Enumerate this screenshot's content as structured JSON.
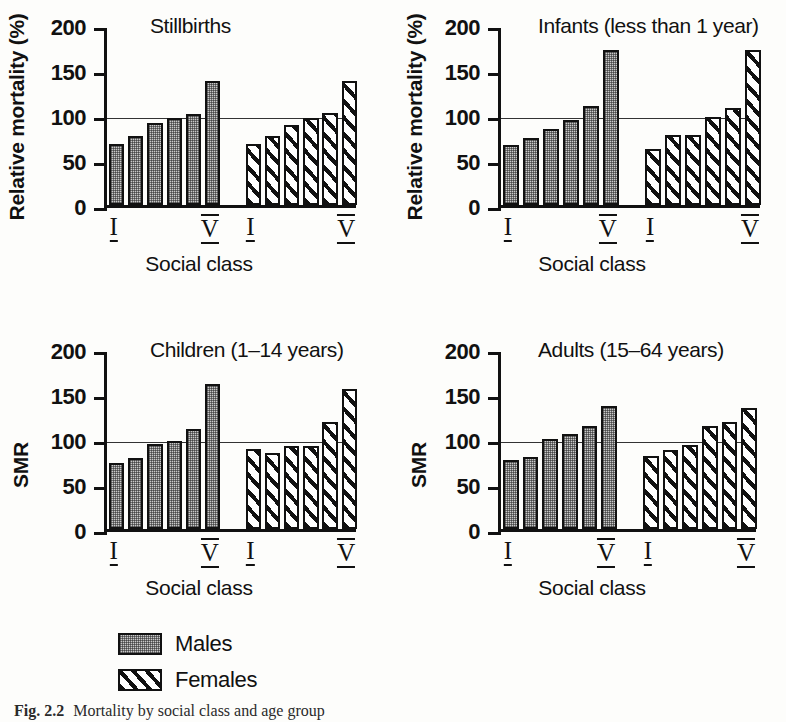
{
  "figure": {
    "caption_number": "Fig. 2.2",
    "caption_text": "Mortality by social class and age group"
  },
  "legend": {
    "items": [
      {
        "key": "males",
        "label": "Males"
      },
      {
        "key": "females",
        "label": "Females"
      }
    ]
  },
  "axis": {
    "x_title": "Social class",
    "tick_labels": [
      "0",
      "50",
      "100",
      "150",
      "200"
    ],
    "class_first": "I",
    "class_last": "V"
  },
  "chart_data": [
    {
      "type": "bar",
      "title": "Stillbirths",
      "xlabel": "Social class",
      "ylabel": "Relative mortality (%)",
      "ylim": [
        0,
        200
      ],
      "yticks": [
        0,
        50,
        100,
        150,
        200
      ],
      "grid": false,
      "reference_line": 100,
      "legend_position": "below-figure",
      "categories": [
        "I",
        "II",
        "III",
        "IV",
        "V",
        "VI"
      ],
      "groups": [
        {
          "name": "Males",
          "classes": [
            "I",
            "II",
            "III",
            "IV",
            "V",
            "VI"
          ],
          "values": [
            68,
            77,
            91,
            97,
            101,
            138
          ]
        },
        {
          "name": "Females",
          "classes": [
            "I",
            "II",
            "III",
            "IV",
            "V",
            "VI"
          ],
          "values": [
            68,
            77,
            89,
            97,
            102,
            138
          ]
        }
      ]
    },
    {
      "type": "bar",
      "title": "Infants (less than 1 year)",
      "xlabel": "Social class",
      "ylabel": "Relative mortality (%)",
      "ylim": [
        0,
        200
      ],
      "yticks": [
        0,
        50,
        100,
        150,
        200
      ],
      "grid": false,
      "reference_line": 100,
      "legend_position": "below-figure",
      "categories": [
        "I",
        "II",
        "III",
        "IV",
        "V",
        "VI"
      ],
      "groups": [
        {
          "name": "Males",
          "classes": [
            "I",
            "II",
            "III",
            "IV",
            "V",
            "VI"
          ],
          "values": [
            67,
            75,
            84,
            94,
            110,
            172
          ]
        },
        {
          "name": "Females",
          "classes": [
            "I",
            "II",
            "III",
            "IV",
            "V",
            "VI"
          ],
          "values": [
            62,
            78,
            78,
            98,
            108,
            172
          ]
        }
      ]
    },
    {
      "type": "bar",
      "title": "Children (1–14 years)",
      "xlabel": "Social class",
      "ylabel": "SMR",
      "ylim": [
        0,
        200
      ],
      "yticks": [
        0,
        50,
        100,
        150,
        200
      ],
      "grid": false,
      "reference_line": 100,
      "legend_position": "below-figure",
      "categories": [
        "I",
        "II",
        "III",
        "IV",
        "V",
        "VI"
      ],
      "groups": [
        {
          "name": "Males",
          "classes": [
            "I",
            "II",
            "III",
            "IV",
            "V",
            "VI"
          ],
          "values": [
            73,
            79,
            94,
            98,
            111,
            161
          ]
        },
        {
          "name": "Females",
          "classes": [
            "I",
            "II",
            "III",
            "IV",
            "V",
            "VI"
          ],
          "values": [
            89,
            84,
            92,
            92,
            119,
            156
          ]
        }
      ]
    },
    {
      "type": "bar",
      "title": "Adults (15–64 years)",
      "xlabel": "Social class",
      "ylabel": "SMR",
      "ylim": [
        0,
        200
      ],
      "yticks": [
        0,
        50,
        100,
        150,
        200
      ],
      "grid": false,
      "reference_line": 100,
      "legend_position": "below-figure",
      "categories": [
        "I",
        "II",
        "III",
        "IV",
        "V",
        "VI"
      ],
      "groups": [
        {
          "name": "Males",
          "classes": [
            "I",
            "II",
            "III",
            "IV",
            "V",
            "VI"
          ],
          "values": [
            77,
            80,
            100,
            106,
            114,
            137
          ]
        },
        {
          "name": "Females",
          "classes": [
            "I",
            "II",
            "III",
            "IV",
            "V",
            "VI"
          ],
          "values": [
            81,
            88,
            93,
            115,
            119,
            134
          ]
        }
      ]
    }
  ]
}
